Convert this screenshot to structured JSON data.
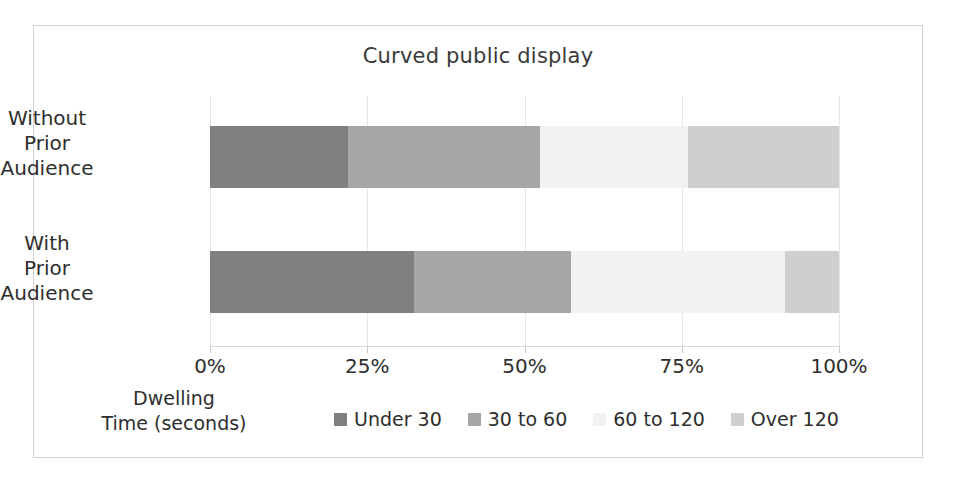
{
  "chart_data": {
    "type": "bar",
    "orientation": "horizontal",
    "stacked": true,
    "normalized": "percent",
    "title": "Curved public display",
    "xlabel": "",
    "ylabel": "",
    "axis_title": "Dwelling\nTime (seconds)",
    "axis_title_lines": [
      "Dwelling",
      "Time (seconds)"
    ],
    "categories": [
      "Without Prior Audience",
      "With Prior Audience"
    ],
    "category_label_lines": [
      [
        "Without",
        "Prior",
        "Audience"
      ],
      [
        "With",
        "Prior",
        "Audience"
      ]
    ],
    "series": [
      {
        "name": "Under 30",
        "values": [
          22.0,
          32.4
        ],
        "color": "#808080"
      },
      {
        "name": "30 to 60",
        "values": [
          30.5,
          25.0
        ],
        "color": "#a6a6a6"
      },
      {
        "name": "60 to 120",
        "values": [
          23.5,
          34.0
        ],
        "color": "#f2f2f2"
      },
      {
        "name": "Over 120",
        "values": [
          24.0,
          8.6
        ],
        "color": "#cfcfcf"
      }
    ],
    "xlim": [
      0,
      100
    ],
    "xticks": [
      0,
      25,
      50,
      75,
      100
    ],
    "xtick_labels": [
      "0%",
      "25%",
      "50%",
      "75%",
      "100%"
    ],
    "grid": true,
    "grid_color": "#e6e6e6",
    "legend_position": "bottom",
    "frame_border_color": "#d3d3d3",
    "background": "#ffffff",
    "text_color": "#2e2e2e"
  }
}
